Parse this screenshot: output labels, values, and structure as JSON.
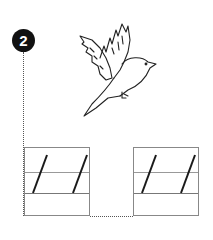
{
  "worksheet": {
    "exercise_number": "2",
    "illustration": "flying-bird",
    "practice_boxes": [
      {
        "strokes": "two slanted lines",
        "label": "left-practice-box"
      },
      {
        "strokes": "two slanted lines",
        "label": "right-practice-box"
      }
    ],
    "colors": {
      "badge": "#111111",
      "lines": "#888888",
      "strokes": "#1a1a1a"
    }
  }
}
